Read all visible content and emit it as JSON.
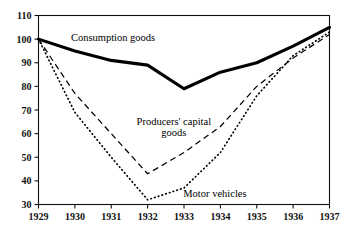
{
  "chart_data": {
    "type": "line",
    "title": "",
    "subtitle": "",
    "xlabel": "",
    "ylabel": "",
    "x": [
      1929,
      1930,
      1931,
      1932,
      1933,
      1934,
      1935,
      1936,
      1937
    ],
    "xtick_labels": [
      "1929",
      "1930",
      "1931",
      "1932",
      "1933",
      "1934",
      "1935",
      "1936",
      "1937"
    ],
    "ytick_labels": [
      "30",
      "40",
      "50",
      "60",
      "70",
      "80",
      "90",
      "100",
      "110"
    ],
    "ytick_values": [
      30,
      40,
      50,
      60,
      70,
      80,
      90,
      100,
      110
    ],
    "xlim": [
      1929,
      1937
    ],
    "ylim": [
      30,
      110
    ],
    "grid": false,
    "legend": "inline-annotations",
    "series": [
      {
        "name": "Consumption goods",
        "style": "solid-thick",
        "values": [
          100,
          95,
          91,
          89,
          79,
          86,
          90,
          97,
          105
        ]
      },
      {
        "name": "Producers' capital goods",
        "style": "dashed",
        "values": [
          100,
          77,
          60,
          43,
          52,
          63,
          80,
          92,
          102
        ]
      },
      {
        "name": "Motor vehicles",
        "style": "dotted",
        "values": [
          100,
          69,
          50,
          32,
          37,
          52,
          76,
          93,
          103
        ]
      }
    ],
    "annotations": [
      {
        "text": "Consumption goods",
        "x": 1931.05,
        "y": 99.0
      },
      {
        "text": "Producers' capital",
        "x": 1932.72,
        "y": 63.6
      },
      {
        "text": "goods",
        "x": 1932.72,
        "y": 59.2
      },
      {
        "text": "Motor vehicles",
        "x": 1933.85,
        "y": 33.2
      }
    ]
  },
  "colors": {
    "axis": "#111111",
    "series": "#000000",
    "background": "#ffffff"
  }
}
